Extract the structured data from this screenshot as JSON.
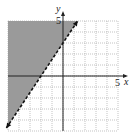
{
  "chart_data": {
    "type": "line",
    "title": "",
    "inequality": "y > (3/2)x + 3",
    "boundary": {
      "slope": 1.5,
      "y_intercept": 3,
      "x_intercept": -2,
      "style": "dashed",
      "points": [
        [
          -5.33,
          -5
        ],
        [
          1.33,
          5
        ]
      ]
    },
    "shaded_region": "above",
    "xlabel": "x",
    "ylabel": "y",
    "xlim": [
      -5,
      5
    ],
    "ylim": [
      -5,
      5
    ],
    "x_tick_labels": [
      "5"
    ],
    "y_tick_labels": [
      "5"
    ],
    "grid": true,
    "grid_style": "dotted",
    "grid_step": 1
  },
  "labels": {
    "x_axis": "x",
    "y_axis": "y",
    "x_tick": "5",
    "y_tick": "5"
  },
  "colors": {
    "shade": "#9a9a9a",
    "grid": "#9a9a9a",
    "axis": "#222222",
    "boundary": "#111111"
  }
}
